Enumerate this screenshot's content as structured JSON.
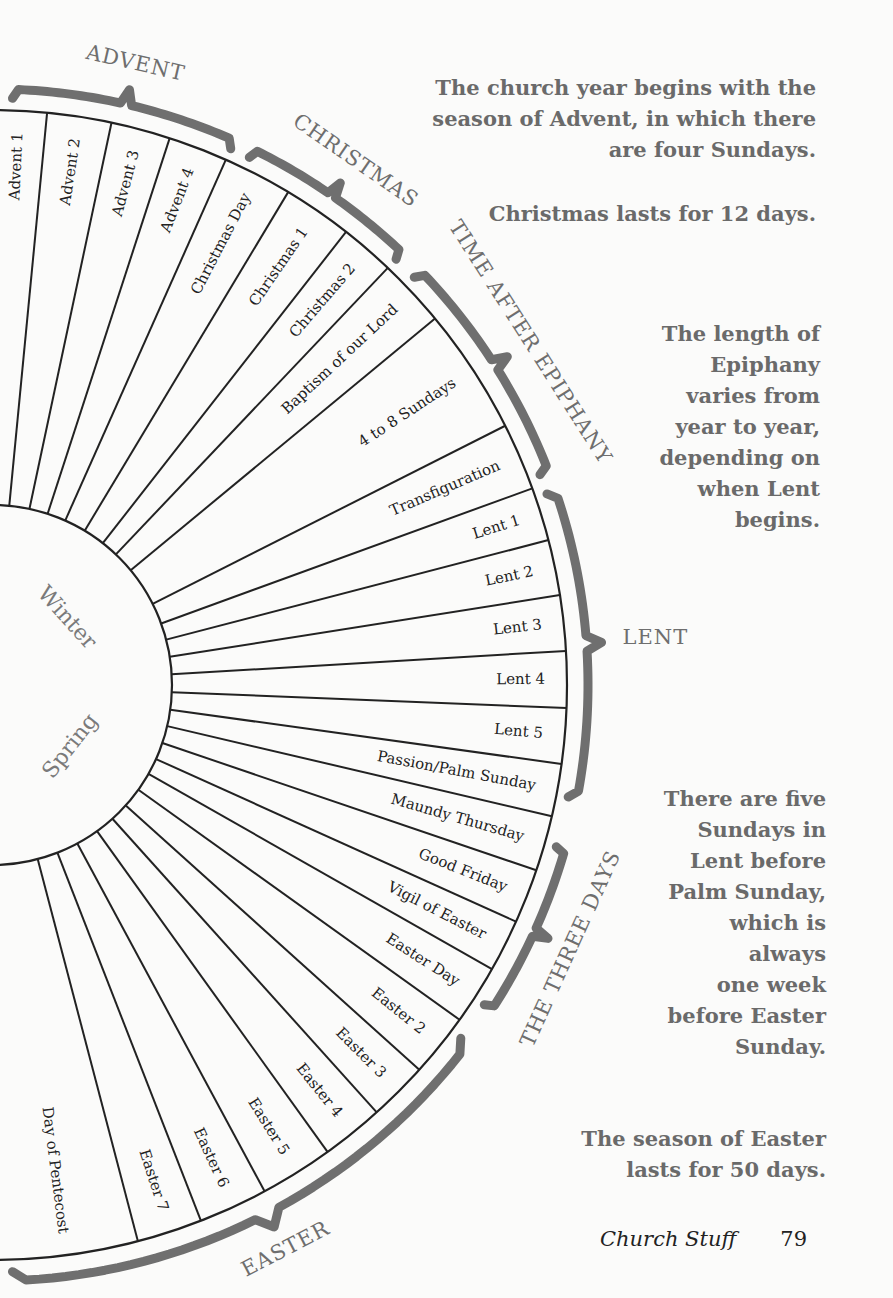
{
  "wheel": {
    "center": [
      -8,
      685
    ],
    "inner_radius": 180,
    "outer_radius": 575,
    "segments": [
      {
        "label": "Advent 1",
        "a0": 90,
        "a1": 84.5
      },
      {
        "label": "Advent 2",
        "a0": 84.5,
        "a1": 78
      },
      {
        "label": "Advent 3",
        "a0": 78,
        "a1": 72
      },
      {
        "label": "Advent 4",
        "a0": 72,
        "a1": 66
      },
      {
        "label": "Christmas Day",
        "a0": 66,
        "a1": 59
      },
      {
        "label": "Christmas 1",
        "a0": 59,
        "a1": 52
      },
      {
        "label": "Christmas 2",
        "a0": 52,
        "a1": 46.5
      },
      {
        "label": "Baptism of our Lord",
        "a0": 46.5,
        "a1": 39.6
      },
      {
        "label": "4 to 8 Sundays",
        "a0": 39.6,
        "a1": 26.8
      },
      {
        "label": "Transfiguration",
        "a0": 26.8,
        "a1": 20
      },
      {
        "label": "Lent 1",
        "a0": 20,
        "a1": 14.6
      },
      {
        "label": "Lent 2",
        "a0": 14.6,
        "a1": 9
      },
      {
        "label": "Lent 3",
        "a0": 9,
        "a1": 3.4
      },
      {
        "label": "Lent 4",
        "a0": 3.4,
        "a1": -2.3
      },
      {
        "label": "Lent 5",
        "a0": -2.3,
        "a1": -7.9
      },
      {
        "label": "Passion/Palm Sunday",
        "a0": -7.9,
        "a1": -13.2
      },
      {
        "label": "Maundy Thursday",
        "a0": -13.2,
        "a1": -18.8
      },
      {
        "label": "Good Friday",
        "a0": -18.8,
        "a1": -24.3
      },
      {
        "label": "Vigil of Easter",
        "a0": -24.3,
        "a1": -29.6
      },
      {
        "label": "Easter Day",
        "a0": -29.6,
        "a1": -35.6
      },
      {
        "label": "Easter 2",
        "a0": -35.6,
        "a1": -42
      },
      {
        "label": "Easter 3",
        "a0": -42,
        "a1": -48
      },
      {
        "label": "Easter 4",
        "a0": -48,
        "a1": -54.3
      },
      {
        "label": "Easter 5",
        "a0": -54.3,
        "a1": -61.7
      },
      {
        "label": "Easter 6",
        "a0": -61.7,
        "a1": -68.7
      },
      {
        "label": "Easter 7",
        "a0": -68.7,
        "a1": -75.3
      },
      {
        "label": "Day of Pentecost",
        "a0": -75.3,
        "a1": -90
      }
    ],
    "quarters": [
      {
        "label": "Winter",
        "angle": 42,
        "radius": 100
      },
      {
        "label": "Spring",
        "angle": -38,
        "radius": 100
      }
    ]
  },
  "seasons": [
    {
      "label": "ADVENT",
      "a0": 88,
      "a1": 66
    },
    {
      "label": "CHRISTMAS",
      "a0": 64,
      "a1": 46.5
    },
    {
      "label": "TIME AFTER EPIPHANY",
      "a0": 44,
      "a1": 21
    },
    {
      "label": "LENT",
      "a0": 19,
      "a1": -11
    },
    {
      "label": "THE THREE DAYS",
      "a0": -16,
      "a1": -33
    },
    {
      "label": "EASTER",
      "a0": -37,
      "a1": -88
    }
  ],
  "notes": [
    {
      "lines": [
        "The church year begins with the",
        "season of Advent, in which there",
        "are four Sundays."
      ]
    },
    {
      "lines": [
        "Christmas lasts for 12 days."
      ]
    },
    {
      "lines": [
        "The length of",
        "Epiphany",
        "varies from",
        "year to year,",
        "depending on",
        "when Lent",
        "begins."
      ]
    },
    {
      "lines": [
        "There are five",
        "Sundays in",
        "Lent before",
        "Palm Sunday,",
        "which is",
        "always",
        "one week",
        "before Easter",
        "Sunday."
      ]
    },
    {
      "lines": [
        "The season of Easter",
        "lasts for 50 days."
      ]
    }
  ],
  "footer": {
    "title": "Church Stuff",
    "page": "79"
  },
  "colors": {
    "ink": "#222222",
    "gray": "#6e6e6e",
    "paper": "#fbfbfa"
  }
}
